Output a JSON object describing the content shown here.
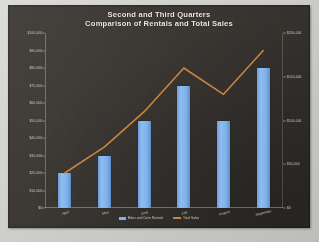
{
  "chart_data": {
    "type": "bar",
    "title": "Second and Third Quarters",
    "subtitle": "Comparison of Rentals and Total Sales",
    "xlabel": "",
    "ylabel": "",
    "grid": false,
    "legend_position": "bottom",
    "categories": [
      "April",
      "May",
      "June",
      "July",
      "August",
      "September"
    ],
    "series": [
      {
        "name": "Bikes and Carts Rentals",
        "type": "bar",
        "color": "#7fb1e8",
        "axis": "left",
        "values": [
          20000,
          30000,
          50000,
          70000,
          50000,
          80000
        ],
        "ylim": [
          0,
          100000
        ],
        "yticks": [
          0,
          10000,
          20000,
          30000,
          40000,
          50000,
          60000,
          70000,
          80000,
          90000,
          100000
        ],
        "ytick_labels": [
          "$0",
          "$10,000",
          "$20,000",
          "$30,000",
          "$40,000",
          "$50,000",
          "$60,000",
          "$70,000",
          "$80,000",
          "$90,000",
          "$100,000"
        ]
      },
      {
        "name": "Total Sales",
        "type": "line",
        "color": "#c8853f",
        "axis": "right",
        "values": [
          40000,
          70000,
          110000,
          160000,
          130000,
          180000
        ],
        "ylim": [
          0,
          200000
        ],
        "yticks": [
          0,
          50000,
          100000,
          150000,
          200000
        ],
        "ytick_labels": [
          "$0",
          "$50,000",
          "$100,000",
          "$150,000",
          "$200,000"
        ]
      }
    ]
  }
}
